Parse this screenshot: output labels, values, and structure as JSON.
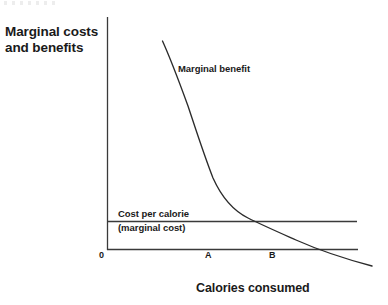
{
  "figure": {
    "width": 388,
    "height": 305,
    "background": "#ffffff",
    "ink_color": "#1a1a1a"
  },
  "chart_data": {
    "type": "line",
    "title": "",
    "ylabel": "Marginal costs\nand benefits",
    "xlabel": "Calories consumed",
    "grid": false,
    "legend": "none",
    "axis_origin_label": "0",
    "xlim": [
      0,
      100
    ],
    "ylim": [
      0,
      100
    ],
    "xticks": [
      "0",
      "A",
      "B"
    ],
    "xtick_positions": [
      0,
      40,
      66
    ],
    "yticks": [],
    "series": [
      {
        "name": "Marginal benefit",
        "label": "Marginal benefit",
        "type": "curve",
        "shape": "convex-decreasing",
        "x": [
          22,
          27,
          31,
          37,
          42,
          47,
          53,
          60,
          66,
          73,
          80,
          87,
          94,
          100
        ],
        "y": [
          90,
          79,
          70,
          58,
          48,
          39,
          31,
          23,
          18,
          13,
          9,
          5,
          2,
          0
        ]
      },
      {
        "name": "Cost per calorie (marginal cost)",
        "label": "Cost per calorie\n(marginal cost)",
        "type": "horizontal-line",
        "value": 12,
        "x": [
          0,
          100
        ],
        "y": [
          12,
          12
        ]
      }
    ],
    "annotations": [
      {
        "text": "Marginal benefit",
        "x": 30,
        "y": 78
      },
      {
        "text": "Cost per calorie",
        "x": 5,
        "y": 16
      },
      {
        "text": "(marginal cost)",
        "x": 5,
        "y": 9
      },
      {
        "text": "A",
        "x": 40,
        "y": -4
      },
      {
        "text": "B",
        "x": 66,
        "y": -4
      }
    ],
    "intersections": [
      {
        "label": "B",
        "x": 67,
        "y": 12,
        "description": "marginal benefit equals marginal cost"
      }
    ]
  },
  "labels": {
    "y_axis_title": "Marginal costs\nand benefits",
    "x_axis_title": "Calories consumed",
    "curve_label": "Marginal benefit",
    "cost_label_line1": "Cost per calorie",
    "cost_label_line2": "(marginal cost)",
    "origin": "0",
    "tick_a": "A",
    "tick_b": "B"
  }
}
